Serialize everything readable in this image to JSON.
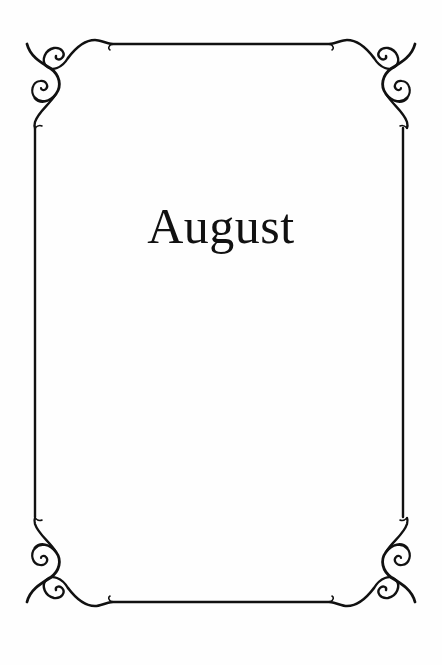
{
  "page": {
    "title": "August",
    "background_color": "#fefefe",
    "ink_color": "#111111"
  },
  "frame": {
    "style": "ornamental-scroll-border",
    "corner_icons": [
      "scroll-ornament-top-left",
      "scroll-ornament-top-right",
      "scroll-ornament-bottom-left",
      "scroll-ornament-bottom-right"
    ]
  }
}
